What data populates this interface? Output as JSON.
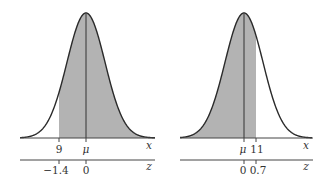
{
  "figure": {
    "colors": {
      "shade": "#b3b3b3",
      "curve": "#2a2a2a",
      "axis": "#444444"
    },
    "left": {
      "x_axis_label": "x",
      "z_axis_label": "z",
      "x_ticks": [
        {
          "label": "9",
          "pos": 59
        },
        {
          "label": "μ",
          "pos": 86
        }
      ],
      "z_ticks": [
        {
          "label": "−1.4",
          "pos": 59
        },
        {
          "label": "0",
          "pos": 86
        }
      ],
      "shaded_region": "right of x = 9 (z = -1.4)"
    },
    "right": {
      "x_axis_label": "x",
      "z_axis_label": "z",
      "x_ticks": [
        {
          "label": "μ",
          "pos": 244
        },
        {
          "label": "11",
          "pos": 256
        }
      ],
      "z_ticks": [
        {
          "label": "0",
          "pos": 244
        },
        {
          "label": "0.7",
          "pos": 256
        }
      ],
      "shaded_region": "left of x = 11 (z = 0.7)"
    }
  }
}
